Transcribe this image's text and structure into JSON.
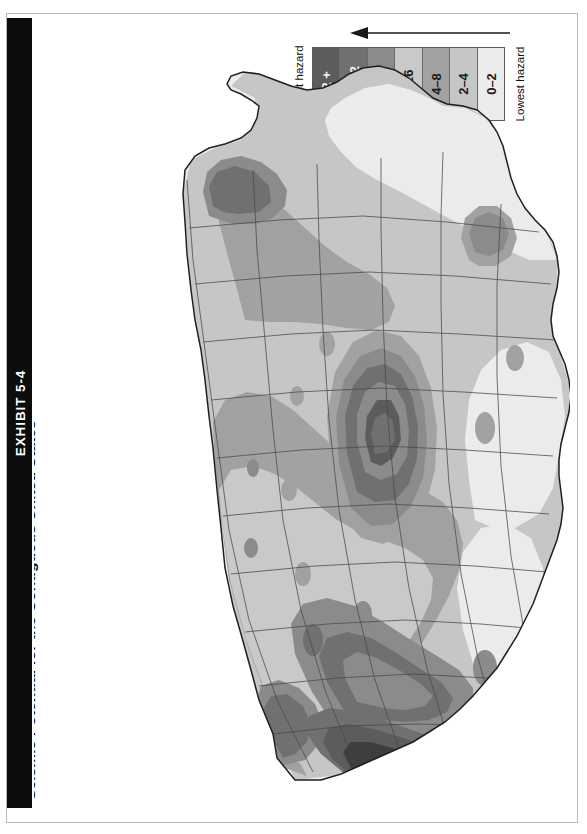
{
  "page": {
    "exhibit_label": "EXHIBIT 5-4",
    "title": "Seismic Potential for the Contiguous United States",
    "orientation": "rotated-90-ccw",
    "background": "#ffffff",
    "border_color": "#b9b9b9",
    "banner_color": "#0c0c0c"
  },
  "legend": {
    "high_label": "Highest hazard",
    "low_label": "Lowest hazard",
    "arrow_direction": "left",
    "arrow_color": "#1a1a1a",
    "bands": [
      {
        "label": "32 +",
        "color": "#5c5c5c",
        "text_tone": "light"
      },
      {
        "label": "24–32",
        "color": "#707070",
        "text_tone": "light"
      },
      {
        "label": "16–24",
        "color": "#8b8b8b",
        "text_tone": "light"
      },
      {
        "label": "8–16",
        "color": "#c9c9c9",
        "text_tone": "dark"
      },
      {
        "label": "4–8",
        "color": "#a2a2a2",
        "text_tone": "dark"
      },
      {
        "label": "2–4",
        "color": "#c6c6c6",
        "text_tone": "dark"
      },
      {
        "label": "0–2",
        "color": "#ececec",
        "text_tone": "dark"
      }
    ]
  },
  "chart_data": {
    "type": "heatmap",
    "title": "Seismic Potential for the Contiguous United States",
    "subtitle": "",
    "xlabel": "",
    "ylabel": "",
    "legend_position": "top-right",
    "grid": false,
    "units": "relative seismic hazard index",
    "categories": [
      "0–2",
      "2–4",
      "4–8",
      "8–16",
      "16–24",
      "24–32",
      "32 +"
    ],
    "values": [
      1,
      3,
      6,
      12,
      20,
      28,
      36
    ],
    "colors": [
      "#ececec",
      "#c6c6c6",
      "#a2a2a2",
      "#c9c9c9",
      "#8b8b8b",
      "#707070",
      "#5c5c5c"
    ],
    "annotations": [
      {
        "region": "California coastal / San Andreas",
        "band": "32 +"
      },
      {
        "region": "Nevada / Basin and Range",
        "band": "16–24"
      },
      {
        "region": "New Madrid (Missouri–Tennessee)",
        "band": "24–32"
      },
      {
        "region": "Charleston, South Carolina",
        "band": "16–24"
      },
      {
        "region": "New England / Maine coast",
        "band": "8–16"
      },
      {
        "region": "Puget Sound, Washington",
        "band": "16–24"
      },
      {
        "region": "Florida peninsula",
        "band": "0–2"
      },
      {
        "region": "Texas interior",
        "band": "0–2"
      }
    ]
  }
}
